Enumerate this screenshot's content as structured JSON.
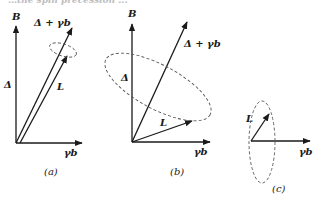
{
  "figure": {
    "header_cutoff_text": "…the spin precession ...",
    "colors": {
      "ink": "#1a1a1a",
      "dashed_ellipse": "#555555"
    },
    "panels": [
      {
        "id": "a",
        "caption": "(a)",
        "axis_vertical_label": "B",
        "axis_horizontal_label": "γb",
        "vector_labels": {
          "delta": "Δ",
          "sum": "Δ + γb",
          "L": "L"
        }
      },
      {
        "id": "b",
        "caption": "(b)",
        "axis_vertical_label": "B",
        "axis_horizontal_label": "γb",
        "vector_labels": {
          "delta": "Δ",
          "sum": "Δ + γb",
          "L": "L"
        }
      },
      {
        "id": "c",
        "caption": "(c)",
        "axis_horizontal_label": "γb",
        "vector_labels": {
          "L": "L"
        }
      }
    ]
  }
}
